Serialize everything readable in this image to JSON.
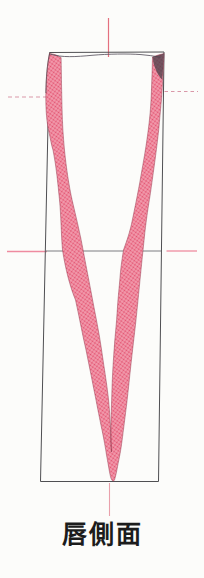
{
  "figure": {
    "caption": "唇側面"
  },
  "colors": {
    "background": "#fcfcfa",
    "box_stroke": "#4f4f52",
    "midline_gray": "#7d7d80",
    "band_base": "#f3a0b1",
    "band_dot": "#e2516f",
    "band_edge": "#8c2f44",
    "level_solid": "#ee8ba0",
    "level_dashed": "#d998a8",
    "axis_top": "#e4707f",
    "axis_bottom": "#e9a0ab",
    "incisal": "#5a5560",
    "accent_dark": "#4a4049",
    "caption_text": "#1c1c1c"
  }
}
